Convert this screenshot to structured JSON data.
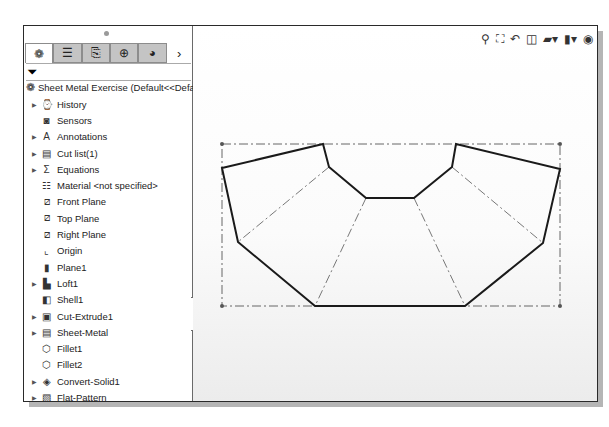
{
  "panel": {
    "tabs": [
      {
        "name": "featuremanager",
        "icon": "featuremanager-icon",
        "glyph": "❁",
        "active": true
      },
      {
        "name": "propertymanager",
        "icon": "propertymanager-icon",
        "glyph": "☰",
        "active": false
      },
      {
        "name": "configurationmanager",
        "icon": "configurationmanager-icon",
        "glyph": "⎘",
        "active": false
      },
      {
        "name": "dimxpertmanager",
        "icon": "dimxpert-icon",
        "glyph": "⊕",
        "active": false
      },
      {
        "name": "displaymanager",
        "icon": "displaymanager-icon",
        "glyph": "◕",
        "active": false
      }
    ],
    "more_glyph": "›",
    "filter_glyph": "⏷",
    "root_label": "Sheet Metal Exercise  (Default<<Default",
    "tree": [
      {
        "label": "History",
        "expandable": true,
        "glyph": "⌚"
      },
      {
        "label": "Sensors",
        "expandable": false,
        "glyph": "◙"
      },
      {
        "label": "Annotations",
        "expandable": true,
        "glyph": "A"
      },
      {
        "label": "Cut list(1)",
        "expandable": true,
        "glyph": "▤"
      },
      {
        "label": "Equations",
        "expandable": true,
        "glyph": "Σ"
      },
      {
        "label": "Material <not specified>",
        "expandable": false,
        "glyph": "☷"
      },
      {
        "label": "Front Plane",
        "expandable": false,
        "glyph": "⧄"
      },
      {
        "label": "Top Plane",
        "expandable": false,
        "glyph": "⧄"
      },
      {
        "label": "Right Plane",
        "expandable": false,
        "glyph": "⧄"
      },
      {
        "label": "Origin",
        "expandable": false,
        "glyph": "⌞"
      },
      {
        "label": "Plane1",
        "expandable": false,
        "glyph": "▮"
      },
      {
        "label": "Loft1",
        "expandable": true,
        "glyph": "▙"
      },
      {
        "label": "Shell1",
        "expandable": false,
        "glyph": "◧"
      },
      {
        "label": "Cut-Extrude1",
        "expandable": true,
        "glyph": "▣"
      },
      {
        "label": "Sheet-Metal",
        "expandable": true,
        "glyph": "▤"
      },
      {
        "label": "Fillet1",
        "expandable": false,
        "glyph": "⬡"
      },
      {
        "label": "Fillet2",
        "expandable": false,
        "glyph": "⬡"
      },
      {
        "label": "Convert-Solid1",
        "expandable": true,
        "glyph": "◈"
      },
      {
        "label": "Flat-Pattern",
        "expandable": true,
        "glyph": "▧"
      }
    ]
  },
  "toolbar": [
    {
      "name": "zoom-to-fit",
      "glyph": "⚲"
    },
    {
      "name": "zoom-to-area",
      "glyph": "⛶"
    },
    {
      "name": "previous-view",
      "glyph": "↶"
    },
    {
      "name": "section-view",
      "glyph": "◫"
    },
    {
      "name": "view-orientation",
      "glyph": "▰▾"
    },
    {
      "name": "display-style",
      "glyph": "▮▾"
    },
    {
      "name": "hide-show-items",
      "glyph": "◉"
    }
  ],
  "sketch": {
    "bbox": [
      [
        29,
        118
      ],
      [
        367,
        118
      ],
      [
        367,
        280
      ],
      [
        29,
        280
      ]
    ],
    "outline": [
      [
        29,
        142
      ],
      [
        130,
        118
      ],
      [
        136,
        141
      ],
      [
        173,
        172
      ],
      [
        221,
        172
      ],
      [
        259,
        141
      ],
      [
        263,
        118
      ],
      [
        367,
        143
      ],
      [
        350,
        217
      ],
      [
        272,
        280
      ],
      [
        122,
        280
      ],
      [
        45,
        216
      ]
    ],
    "bend_lines": [
      [
        [
          136,
          141
        ],
        [
          45,
          216
        ]
      ],
      [
        [
          173,
          172
        ],
        [
          122,
          280
        ]
      ],
      [
        [
          221,
          172
        ],
        [
          272,
          280
        ]
      ],
      [
        [
          259,
          141
        ],
        [
          350,
          217
        ]
      ]
    ]
  }
}
